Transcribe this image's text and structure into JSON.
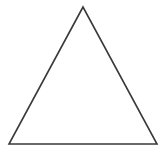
{
  "canvas": {
    "width": 165,
    "height": 161,
    "background_color": "#ffffff"
  },
  "figure": {
    "type": "triangle-outline",
    "vertices": [
      {
        "x": 83,
        "y": 7
      },
      {
        "x": 9,
        "y": 144
      },
      {
        "x": 157,
        "y": 144
      }
    ],
    "stroke_color": "#3a3a3a",
    "stroke_width": 1.6,
    "fill": "none"
  }
}
